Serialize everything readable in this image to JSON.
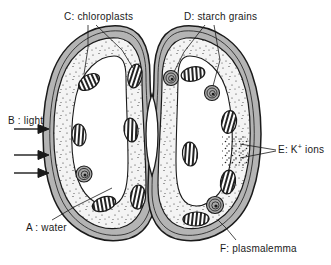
{
  "figure": {
    "line_color": "#1a1a1a",
    "wall_color": "#b4b4b4",
    "cytoplasm_color": "#f2f2f2",
    "vacuole_color": "#ffffff",
    "starch_color": "#9a9a9a",
    "background_color": "#ffffff"
  },
  "labels": {
    "a": {
      "key": "A",
      "sep": ":",
      "text": "water",
      "full": "A : water"
    },
    "b": {
      "key": "B",
      "sep": ":",
      "text": "light",
      "full": "B : light"
    },
    "c": {
      "key": "C",
      "sep": ":",
      "text": "chloroplasts",
      "full": "C: chloroplasts"
    },
    "d": {
      "key": "D",
      "sep": ":",
      "text": "starch grains",
      "full": "D: starch grains"
    },
    "e": {
      "key": "E",
      "sep": ":",
      "text_pre": "K",
      "text_sup": "+",
      "text_post": " ions",
      "full": "E: K+ ions"
    },
    "f": {
      "key": "F",
      "sep": ":",
      "text": "plasmalemma",
      "full": "F: plasmalemma"
    }
  },
  "structures": {
    "guard_cell_left": "left guard cell",
    "guard_cell_right": "right guard cell",
    "stomatal_pore": "stomatal pore",
    "cell_wall": "cell wall",
    "cytoplasm": "cytoplasm",
    "vacuole": "vacuole",
    "chloroplast_count_left": 5,
    "chloroplast_count_right": 5,
    "starch_grain_count_left": 1,
    "starch_grain_count_right": 3,
    "light_arrow_count": 3
  }
}
